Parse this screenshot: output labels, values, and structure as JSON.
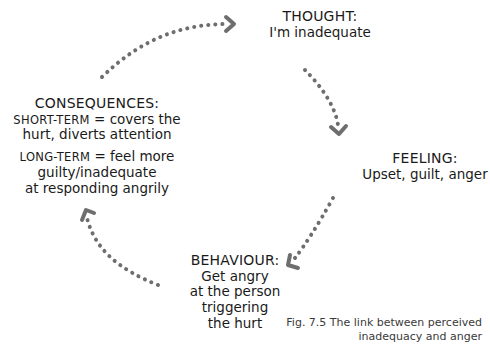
{
  "diagram": {
    "type": "cycle",
    "arrow_color": "#6e6e6e",
    "nodes": {
      "thought": {
        "title": "THOUGHT:",
        "lines": [
          "I'm inadequate"
        ]
      },
      "feeling": {
        "title": "FEELING:",
        "lines": [
          "Upset, guilt, anger"
        ]
      },
      "behaviour": {
        "title": "BEHAVIOUR:",
        "lines": [
          "Get angry",
          "at the person",
          "triggering",
          "the hurt"
        ]
      },
      "consequences": {
        "title": "CONSEQUENCES:",
        "short_term_label": "SHORT-TERM",
        "short_term_text_1": " = covers the",
        "short_term_text_2": "hurt, diverts attention",
        "long_term_label": "LONG-TERM",
        "long_term_text_1": " = feel more",
        "long_term_text_2": "guilty/inadequate",
        "long_term_text_3": "at responding angrily"
      }
    },
    "flow": [
      "thought",
      "feeling",
      "behaviour",
      "consequences",
      "thought"
    ]
  },
  "caption": {
    "line1": "Fig. 7.5 The link between perceived",
    "line2": "inadequacy and anger"
  }
}
